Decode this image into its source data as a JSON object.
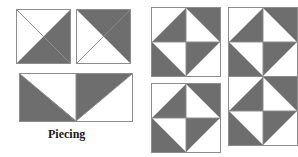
{
  "figure": {
    "title": "Piecing",
    "width": 298,
    "height": 157,
    "background_color": "#ffffff",
    "fabric_dark_color": "#6e6e6e",
    "fabric_light_color": "#ffffff",
    "seam_line_color": "#8d8d8d"
  },
  "caption": {
    "text": "Piecing",
    "x": 48,
    "y": 127,
    "font_size": 12
  },
  "units": [
    {
      "id": "hst-unit-1",
      "name": "half-square-triangle-white-top-left",
      "label": "Half-square triangle unit, dark on lower right",
      "x": 16,
      "y": 9,
      "width": 55,
      "height": 55,
      "quadrants": [
        {
          "position": "whole",
          "dark_corner": "bottom-right",
          "diagonal": "tl-br"
        }
      ]
    },
    {
      "id": "hst-unit-2",
      "name": "half-square-triangle-dark-top-right",
      "label": "Half-square triangle unit, dark on upper right",
      "x": 76,
      "y": 9,
      "width": 55,
      "height": 55,
      "quadrants": [
        {
          "position": "whole",
          "dark_corner": "top-right",
          "diagonal": "bl-tr"
        }
      ]
    },
    {
      "id": "joined-pair",
      "name": "joined-triangle-pair-rectangle",
      "label": "Two half-square triangle units sewn together",
      "x": 19,
      "y": 73,
      "width": 114,
      "height": 49,
      "halves": [
        {
          "position": "left",
          "dark_corner": "bottom-left",
          "diagonal": "tl-br"
        },
        {
          "position": "right",
          "dark_corner": "top-left",
          "diagonal": "tl-br"
        }
      ]
    },
    {
      "id": "pinwheel-block-1",
      "name": "pinwheel-block-top-left",
      "label": "Completed pinwheel block",
      "x": 151,
      "y": 7,
      "width": 70,
      "height": 70
    },
    {
      "id": "pinwheel-block-2",
      "name": "pinwheel-block-bottom-middle",
      "label": "Completed pinwheel block",
      "x": 151,
      "y": 83,
      "width": 70,
      "height": 70
    },
    {
      "id": "pinwheel-block-3",
      "name": "pinwheel-block-right-upper",
      "label": "Pinwheel block joined in quilt section",
      "x": 228,
      "y": 7,
      "width": 70,
      "height": 70
    },
    {
      "id": "pinwheel-block-4",
      "name": "pinwheel-block-right-lower",
      "label": "Pinwheel block joined in quilt section",
      "x": 228,
      "y": 76,
      "width": 70,
      "height": 70
    }
  ],
  "pinwheel_quadrants": [
    {
      "position": "top-left",
      "dark_corner": "bottom-right",
      "diagonal": "bl-tr"
    },
    {
      "position": "top-right",
      "dark_corner": "top-right",
      "diagonal": "tl-br"
    },
    {
      "position": "bottom-left",
      "dark_corner": "bottom-left",
      "diagonal": "tl-br"
    },
    {
      "position": "bottom-right",
      "dark_corner": "top-left",
      "diagonal": "bl-tr"
    }
  ]
}
